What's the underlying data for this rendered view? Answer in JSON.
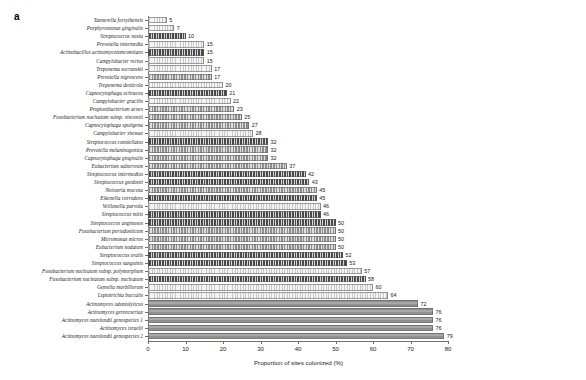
{
  "panel": {
    "letter": "a"
  },
  "chart_data": {
    "type": "bar",
    "orientation": "horizontal",
    "title": "",
    "subtitle": "",
    "xlabel": "Proportion of sites colonized (%)",
    "ylabel": "",
    "xlim": [
      0,
      80
    ],
    "xticks": [
      0,
      10,
      20,
      30,
      40,
      50,
      60,
      70,
      80
    ],
    "grid": false,
    "legend": null,
    "categories": [
      "Tannerella forsythensis",
      "Porphyromonas gingivalis",
      "Streptococcus noxia",
      "Prevotella intermedia",
      "Actinobacillus actinomycetemcomitans",
      "Campylobacter rectus",
      "Treponema socranskii",
      "Prevotella nigrescens",
      "Treponema denticola",
      "Capnocytophaga ochracea",
      "Campylobacter gracilis",
      "Propionibacterium acnes",
      "Fusobacterium nucleatum subsp. vincentii",
      "Capnocytophaga sputigena",
      "Campylobacter showae",
      "Streptococcus constellatus",
      "Prevotella melaninogenica",
      "Capnocytophaga gingivalis",
      "Eubacterium saburreum",
      "Streptococcus intermedius",
      "Streptococcus gordonii",
      "Neisseria mucosa",
      "Eikenella corrodens",
      "Veillonella parvula",
      "Streptococcus mitis",
      "Streptococcus anginosus",
      "Fusobacterium periodonticum",
      "Micromonas micros",
      "Eubacterium nodatum",
      "Streptococcus oralis",
      "Streptococcus sanguinis",
      "Fusobacterium nucleatum subsp. polymorphum",
      "Fusobacterium nucleatum subsp. nucleatum",
      "Gemella morbillorum",
      "Leptotrichia buccalis",
      "Actinomyces odontolyticus",
      "Actinomyces gerencseriae",
      "Actinomyces naeslundii genospecies 1",
      "Actinomyces israelii",
      "Actinomyces naeslundii genospecies 2"
    ],
    "values": [
      5,
      7,
      10,
      15,
      15,
      15,
      17,
      17,
      20,
      21,
      22,
      23,
      25,
      27,
      28,
      32,
      32,
      32,
      37,
      42,
      43,
      45,
      45,
      46,
      46,
      50,
      50,
      50,
      50,
      52,
      53,
      57,
      58,
      60,
      64,
      72,
      76,
      76,
      76,
      79
    ],
    "value_labels": [
      "5",
      "7",
      "10",
      "15",
      "15",
      "15",
      "17",
      "17",
      "20",
      "21",
      "22",
      "23",
      "25",
      "27",
      "28",
      "32",
      "32",
      "32",
      "37",
      "42",
      "43",
      "45",
      "45",
      "46",
      "46",
      "50",
      "50",
      "50",
      "50",
      "52",
      "53",
      "57",
      "58",
      "60",
      "64",
      "72",
      "76",
      "76",
      "76",
      "79"
    ],
    "bar_styles": [
      "light",
      "light",
      "dark",
      "light",
      "dark",
      "light",
      "light",
      "mid",
      "light",
      "dark",
      "light",
      "mid",
      "mid",
      "mid",
      "light",
      "dark",
      "mid",
      "mid",
      "mid",
      "dark",
      "dark",
      "mid",
      "dark",
      "light",
      "dark",
      "dark",
      "mid",
      "mid",
      "mid",
      "dark",
      "dark",
      "light",
      "dark",
      "light",
      "light",
      "solid",
      "solid",
      "solid",
      "solid",
      "solid"
    ]
  },
  "colors": {
    "axis": "#6e6e6e",
    "bar_dark": "#4a4a4a",
    "bar_mid": "#8f8f8f",
    "bar_light": "#d8d8d8",
    "bar_solid": "#9d9d9d",
    "text": "#1a1a1a",
    "background": "#ffffff"
  }
}
